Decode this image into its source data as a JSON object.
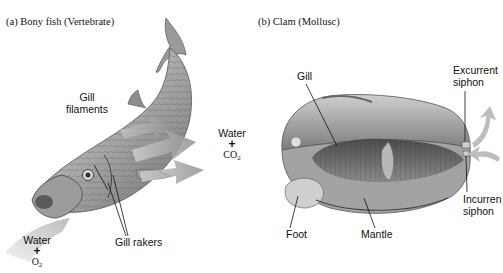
{
  "figure": {
    "panels": [
      {
        "id": "a",
        "caption": "(a)  Bony fish (Vertebrate)",
        "labels": {
          "gill_filaments_line1": "Gill",
          "gill_filaments_line2": "filaments",
          "gill_rakers": "Gill rakers"
        },
        "water_in": {
          "line1": "Water",
          "plus": "+",
          "molecule": "O",
          "subscript": "2"
        },
        "water_out": {
          "line1": "Water",
          "plus": "+",
          "molecule": "CO",
          "subscript": "2"
        }
      },
      {
        "id": "b",
        "caption": "(b)  Clam (Mollusc)",
        "labels": {
          "gill": "Gill",
          "excurrent_line1": "Excurrent",
          "excurrent_line2": "siphon",
          "incurrent_line1": "Incurren",
          "incurrent_line2": "siphon",
          "foot": "Foot",
          "mantle": "Mantle"
        }
      }
    ],
    "colors": {
      "arrow_gray": "#9a9a9a",
      "fish_body": "#b9b9b9",
      "clam_shell": "#a8a8a8",
      "text": "#111111"
    }
  }
}
